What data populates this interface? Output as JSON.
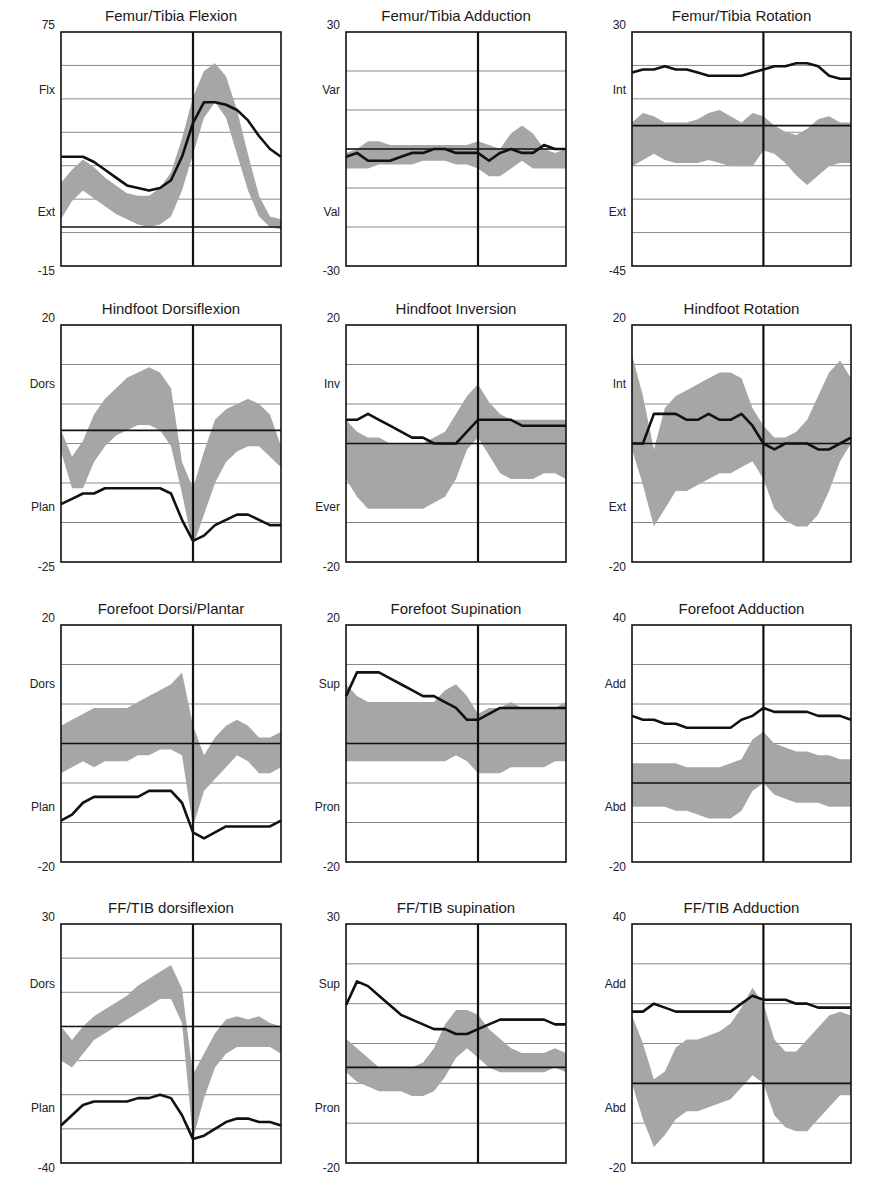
{
  "colors": {
    "band": "#a6a6a6",
    "mean": "#111111",
    "grid": "#8a8a8a",
    "axis": "#111111",
    "background": "#ffffff"
  },
  "chart_data": [
    {
      "id": "femur-tibia-flexion",
      "type": "area",
      "title": "Femur/Tibia Flexion",
      "ylim": [
        -15,
        75
      ],
      "ytick_top": "75",
      "ytick_bottom": "-15",
      "ylabel_top": "Flx",
      "ylabel_bottom": "Ext",
      "gridlines": 7,
      "toe_off_pct": 60,
      "x": [
        0,
        5,
        10,
        15,
        20,
        25,
        30,
        35,
        40,
        45,
        50,
        55,
        60,
        65,
        70,
        75,
        80,
        85,
        90,
        95,
        100
      ],
      "band_upper": [
        17,
        22,
        26,
        23,
        19,
        16,
        13,
        12,
        12,
        15,
        21,
        34,
        50,
        60,
        63,
        58,
        45,
        28,
        12,
        4,
        3
      ],
      "band_lower": [
        3,
        10,
        14,
        11,
        8,
        5,
        3,
        1,
        0,
        1,
        4,
        14,
        28,
        42,
        48,
        42,
        28,
        14,
        4,
        0,
        -1
      ],
      "mean": [
        27,
        27,
        27,
        25,
        22,
        19,
        16,
        15,
        14,
        15,
        18,
        27,
        40,
        48,
        48,
        47,
        45,
        41,
        35,
        30,
        27
      ]
    },
    {
      "id": "femur-tibia-adduction",
      "type": "area",
      "title": "Femur/Tibia Adduction",
      "ylim": [
        -30,
        30
      ],
      "ytick_top": "30",
      "ytick_bottom": "-30",
      "ylabel_top": "Var",
      "ylabel_bottom": "Val",
      "gridlines": 6,
      "toe_off_pct": 60,
      "x": [
        0,
        5,
        10,
        15,
        20,
        25,
        30,
        35,
        40,
        45,
        50,
        55,
        60,
        65,
        70,
        75,
        80,
        85,
        90,
        95,
        100
      ],
      "band_upper": [
        -1,
        0,
        2,
        2,
        1,
        1,
        1,
        1,
        1,
        1,
        1,
        1,
        2,
        1,
        0,
        4,
        6,
        4,
        0,
        -1,
        0
      ],
      "band_lower": [
        -5,
        -5,
        -5,
        -4,
        -4,
        -4,
        -4,
        -3,
        -3,
        -3,
        -4,
        -4,
        -5,
        -7,
        -7,
        -5,
        -3,
        -5,
        -5,
        -5,
        -5
      ],
      "mean": [
        -2,
        -1,
        -3,
        -3,
        -3,
        -2,
        -1,
        -1,
        0,
        0,
        -1,
        -1,
        -1,
        -3,
        -1,
        0,
        -1,
        -1,
        1,
        0,
        0
      ]
    },
    {
      "id": "femur-tibia-rotation",
      "type": "area",
      "title": "Femur/Tibia Rotation",
      "ylim": [
        -45,
        30
      ],
      "ytick_top": "30",
      "ytick_bottom": "-45",
      "ylabel_top": "Int",
      "ylabel_bottom": "Ext",
      "gridlines": 7,
      "toe_off_pct": 60,
      "x": [
        0,
        5,
        10,
        15,
        20,
        25,
        30,
        35,
        40,
        45,
        50,
        55,
        60,
        65,
        70,
        75,
        80,
        85,
        90,
        95,
        100
      ],
      "band_upper": [
        1,
        4,
        3,
        1,
        1,
        1,
        2,
        4,
        5,
        3,
        1,
        4,
        3,
        0,
        -2,
        -3,
        -1,
        2,
        3,
        1,
        1
      ],
      "band_lower": [
        -13,
        -11,
        -9,
        -11,
        -12,
        -12,
        -12,
        -11,
        -12,
        -13,
        -13,
        -13,
        -8,
        -9,
        -12,
        -16,
        -19,
        -16,
        -13,
        -12,
        -12
      ],
      "mean": [
        17,
        18,
        18,
        19,
        18,
        18,
        17,
        16,
        16,
        16,
        16,
        17,
        18,
        19,
        19,
        20,
        20,
        19,
        16,
        15,
        15
      ]
    },
    {
      "id": "hindfoot-dorsiflexion",
      "type": "area",
      "title": "Hindfoot Dorsiflexion",
      "ylim": [
        -25,
        20
      ],
      "ytick_top": "20",
      "ytick_bottom": "-25",
      "ylabel_top": "Dors",
      "ylabel_bottom": "Plan",
      "gridlines": 6,
      "toe_off_pct": 60,
      "x": [
        0,
        5,
        10,
        15,
        20,
        25,
        30,
        35,
        40,
        45,
        50,
        55,
        60,
        65,
        70,
        75,
        80,
        85,
        90,
        95,
        100
      ],
      "band_upper": [
        0,
        -5,
        -2,
        3,
        6,
        8,
        10,
        11,
        12,
        11,
        8,
        -6,
        -11,
        -4,
        2,
        4,
        5,
        6,
        5,
        3,
        -3
      ],
      "band_lower": [
        -4,
        -11,
        -11,
        -6,
        -3,
        -1,
        0,
        1,
        1,
        0,
        -3,
        -12,
        -22,
        -16,
        -10,
        -6,
        -4,
        -3,
        -3,
        -5,
        -7
      ],
      "mean": [
        -14,
        -13,
        -12,
        -12,
        -11,
        -11,
        -11,
        -11,
        -11,
        -11,
        -12,
        -17,
        -21,
        -20,
        -18,
        -17,
        -16,
        -16,
        -17,
        -18,
        -18
      ]
    },
    {
      "id": "hindfoot-inversion",
      "type": "area",
      "title": "Hindfoot Inversion",
      "ylim": [
        -20,
        20
      ],
      "ytick_top": "20",
      "ytick_bottom": "-20",
      "ylabel_top": "Inv",
      "ylabel_bottom": "Ever",
      "gridlines": 6,
      "toe_off_pct": 60,
      "x": [
        0,
        5,
        10,
        15,
        20,
        25,
        30,
        35,
        40,
        45,
        50,
        55,
        60,
        65,
        70,
        75,
        80,
        85,
        90,
        95,
        100
      ],
      "band_upper": [
        4,
        2,
        1,
        1,
        0,
        0,
        0,
        0,
        1,
        2,
        5,
        8,
        10,
        7,
        5,
        4,
        4,
        4,
        4,
        4,
        4
      ],
      "band_lower": [
        -6,
        -9,
        -11,
        -11,
        -11,
        -11,
        -11,
        -11,
        -10,
        -9,
        -6,
        -1,
        1,
        -2,
        -5,
        -6,
        -6,
        -6,
        -5,
        -5,
        -6
      ],
      "mean": [
        4,
        4,
        5,
        4,
        3,
        2,
        1,
        1,
        0,
        0,
        0,
        2,
        4,
        4,
        4,
        4,
        3,
        3,
        3,
        3,
        3
      ]
    },
    {
      "id": "hindfoot-rotation",
      "type": "area",
      "title": "Hindfoot Rotation",
      "ylim": [
        -20,
        20
      ],
      "ytick_top": "20",
      "ytick_bottom": "-20",
      "ylabel_top": "Int",
      "ylabel_bottom": "Ext",
      "gridlines": 6,
      "toe_off_pct": 60,
      "x": [
        0,
        5,
        10,
        15,
        20,
        25,
        30,
        35,
        40,
        45,
        50,
        55,
        60,
        65,
        70,
        75,
        80,
        85,
        90,
        95,
        100
      ],
      "band_upper": [
        15,
        8,
        -1,
        6,
        8,
        9,
        10,
        11,
        12,
        12,
        11,
        6,
        3,
        1,
        1,
        2,
        4,
        8,
        12,
        14,
        11
      ],
      "band_lower": [
        -1,
        -7,
        -14,
        -11,
        -8,
        -8,
        -7,
        -6,
        -5,
        -5,
        -4,
        -3,
        -6,
        -11,
        -13,
        -14,
        -14,
        -12,
        -8,
        -3,
        0
      ],
      "mean": [
        0,
        0,
        5,
        5,
        5,
        4,
        4,
        5,
        4,
        4,
        5,
        3,
        0,
        -1,
        0,
        0,
        0,
        -1,
        -1,
        0,
        1
      ]
    },
    {
      "id": "forefoot-dorsi-plantar",
      "type": "area",
      "title": "Forefoot  Dorsi/Plantar",
      "ylim": [
        -20,
        20
      ],
      "ytick_top": "20",
      "ytick_bottom": "-20",
      "ylabel_top": "Dors",
      "ylabel_bottom": "Plan",
      "gridlines": 6,
      "toe_off_pct": 60,
      "x": [
        0,
        5,
        10,
        15,
        20,
        25,
        30,
        35,
        40,
        45,
        50,
        55,
        60,
        65,
        70,
        75,
        80,
        85,
        90,
        95,
        100
      ],
      "band_upper": [
        3,
        4,
        5,
        6,
        6,
        6,
        6,
        7,
        8,
        9,
        10,
        12,
        3,
        -2,
        1,
        3,
        4,
        3,
        1,
        1,
        2
      ],
      "band_lower": [
        -5,
        -4,
        -3,
        -4,
        -3,
        -3,
        -3,
        -2,
        -2,
        -1,
        -1,
        -2,
        -14,
        -8,
        -6,
        -4,
        -2,
        -3,
        -5,
        -5,
        -4
      ],
      "mean": [
        -13,
        -12,
        -10,
        -9,
        -9,
        -9,
        -9,
        -9,
        -8,
        -8,
        -8,
        -10,
        -15,
        -16,
        -15,
        -14,
        -14,
        -14,
        -14,
        -14,
        -13
      ]
    },
    {
      "id": "forefoot-supination",
      "type": "area",
      "title": "Forefoot Supination",
      "ylim": [
        -20,
        20
      ],
      "ytick_top": "20",
      "ytick_bottom": "-20",
      "ylabel_top": "Sup",
      "ylabel_bottom": "Pron",
      "gridlines": 6,
      "toe_off_pct": 60,
      "x": [
        0,
        5,
        10,
        15,
        20,
        25,
        30,
        35,
        40,
        45,
        50,
        55,
        60,
        65,
        70,
        75,
        80,
        85,
        90,
        95,
        100
      ],
      "band_upper": [
        10,
        8,
        7,
        7,
        7,
        7,
        7,
        7,
        7,
        9,
        10,
        8,
        5,
        6,
        6,
        7,
        6,
        6,
        6,
        6,
        7
      ],
      "band_lower": [
        -3,
        -3,
        -3,
        -3,
        -3,
        -3,
        -3,
        -3,
        -3,
        -3,
        -2,
        -3,
        -5,
        -5,
        -5,
        -4,
        -4,
        -4,
        -4,
        -3,
        -3
      ],
      "mean": [
        8,
        12,
        12,
        12,
        11,
        10,
        9,
        8,
        8,
        7,
        6,
        4,
        4,
        5,
        6,
        6,
        6,
        6,
        6,
        6,
        6
      ]
    },
    {
      "id": "forefoot-adduction",
      "type": "area",
      "title": "Forefoot Adduction",
      "ylim": [
        -20,
        40
      ],
      "ytick_top": "40",
      "ytick_bottom": "-20",
      "ylabel_top": "Add",
      "ylabel_bottom": "Abd",
      "gridlines": 6,
      "toe_off_pct": 60,
      "x": [
        0,
        5,
        10,
        15,
        20,
        25,
        30,
        35,
        40,
        45,
        50,
        55,
        60,
        65,
        70,
        75,
        80,
        85,
        90,
        95,
        100
      ],
      "band_upper": [
        5,
        5,
        5,
        5,
        5,
        4,
        4,
        4,
        4,
        5,
        6,
        11,
        13,
        10,
        9,
        8,
        8,
        7,
        7,
        6,
        6
      ],
      "band_lower": [
        -6,
        -6,
        -6,
        -6,
        -7,
        -7,
        -8,
        -9,
        -9,
        -9,
        -7,
        -2,
        0,
        -3,
        -4,
        -5,
        -5,
        -5,
        -6,
        -6,
        -6
      ],
      "mean": [
        17,
        16,
        16,
        15,
        15,
        14,
        14,
        14,
        14,
        14,
        16,
        17,
        19,
        18,
        18,
        18,
        18,
        17,
        17,
        17,
        16
      ]
    },
    {
      "id": "ff-tib-dorsiflexion",
      "type": "area",
      "title": "FF/TIB dorsiflexion",
      "ylim": [
        -40,
        30
      ],
      "ytick_top": "30",
      "ytick_bottom": "-40",
      "ylabel_top": "Dors",
      "ylabel_bottom": "Plan",
      "gridlines": 7,
      "toe_off_pct": 60,
      "x": [
        0,
        5,
        10,
        15,
        20,
        25,
        30,
        35,
        40,
        45,
        50,
        55,
        60,
        65,
        70,
        75,
        80,
        85,
        90,
        95,
        100
      ],
      "band_upper": [
        0,
        -4,
        0,
        3,
        5,
        7,
        9,
        12,
        14,
        16,
        18,
        11,
        -14,
        -8,
        -2,
        2,
        3,
        2,
        3,
        1,
        0
      ],
      "band_lower": [
        -10,
        -12,
        -8,
        -4,
        -2,
        0,
        2,
        4,
        6,
        8,
        8,
        1,
        -33,
        -21,
        -12,
        -8,
        -6,
        -6,
        -6,
        -6,
        -8
      ],
      "mean": [
        -29,
        -26,
        -23,
        -22,
        -22,
        -22,
        -22,
        -21,
        -21,
        -20,
        -21,
        -26,
        -33,
        -32,
        -30,
        -28,
        -27,
        -27,
        -28,
        -28,
        -29
      ]
    },
    {
      "id": "ff-tib-supination",
      "type": "area",
      "title": "FF/TIB supination",
      "ylim": [
        -20,
        30
      ],
      "ytick_top": "30",
      "ytick_bottom": "-20",
      "ylabel_top": "Sup",
      "ylabel_bottom": "Pron",
      "gridlines": 6,
      "toe_off_pct": 60,
      "x": [
        0,
        5,
        10,
        15,
        20,
        25,
        30,
        35,
        40,
        45,
        50,
        55,
        60,
        65,
        70,
        75,
        80,
        85,
        90,
        95,
        100
      ],
      "band_upper": [
        6,
        4,
        2,
        0,
        0,
        0,
        0,
        1,
        4,
        9,
        12,
        12,
        11,
        8,
        6,
        4,
        3,
        3,
        3,
        4,
        3
      ],
      "band_lower": [
        -1,
        -3,
        -4,
        -5,
        -5,
        -5,
        -6,
        -6,
        -5,
        -2,
        2,
        4,
        2,
        0,
        -1,
        -1,
        -1,
        -1,
        -1,
        0,
        -1
      ],
      "mean": [
        13,
        18,
        17,
        15,
        13,
        11,
        10,
        9,
        8,
        8,
        7,
        7,
        8,
        9,
        10,
        10,
        10,
        10,
        10,
        9,
        9
      ]
    },
    {
      "id": "ff-tib-adduction",
      "type": "area",
      "title": "FF/TIB Adduction",
      "ylim": [
        -20,
        40
      ],
      "ytick_top": "40",
      "ytick_bottom": "-20",
      "ylabel_top": "Add",
      "ylabel_bottom": "Abd",
      "gridlines": 6,
      "toe_off_pct": 60,
      "x": [
        0,
        5,
        10,
        15,
        20,
        25,
        30,
        35,
        40,
        45,
        50,
        55,
        60,
        65,
        70,
        75,
        80,
        85,
        90,
        95,
        100
      ],
      "band_upper": [
        17,
        10,
        1,
        3,
        9,
        11,
        11,
        12,
        13,
        15,
        19,
        24,
        20,
        11,
        8,
        8,
        11,
        14,
        17,
        18,
        17
      ],
      "band_lower": [
        0,
        -9,
        -16,
        -13,
        -9,
        -7,
        -7,
        -6,
        -5,
        -4,
        -1,
        2,
        0,
        -8,
        -11,
        -12,
        -12,
        -9,
        -6,
        -3,
        -3
      ],
      "mean": [
        18,
        18,
        20,
        19,
        18,
        18,
        18,
        18,
        18,
        18,
        20,
        22,
        21,
        21,
        21,
        20,
        20,
        19,
        19,
        19,
        19
      ]
    }
  ]
}
